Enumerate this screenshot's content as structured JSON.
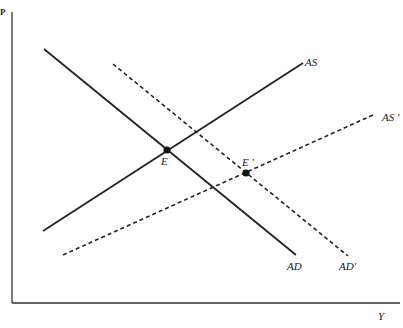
{
  "axes": {
    "y_label": "P",
    "x_label": "Y"
  },
  "curves": {
    "AS": {
      "label": "AS",
      "style": "solid"
    },
    "AS_prime": {
      "label": "AS '",
      "style": "dashed"
    },
    "AD": {
      "label": "AD",
      "style": "solid"
    },
    "AD_prime": {
      "label": "AD'",
      "style": "dashed"
    }
  },
  "points": {
    "E": {
      "label": "E"
    },
    "E_prime": {
      "label": "E '"
    }
  },
  "colors": {
    "line": "#222222",
    "background": "#ffffff"
  }
}
